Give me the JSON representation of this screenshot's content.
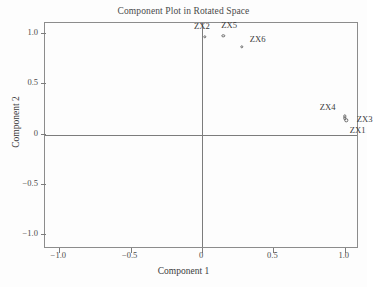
{
  "chart_data": {
    "type": "scatter",
    "title": "Component Plot in Rotated Space",
    "xlabel": "Component 1",
    "ylabel": "Component 2",
    "xlim": [
      -1.1,
      1.1
    ],
    "ylim": [
      -1.15,
      1.1
    ],
    "grid": false,
    "legend": null,
    "xticks": [
      -1.0,
      -0.5,
      0,
      0.5,
      1.0
    ],
    "xticklabels": [
      "-1.0",
      "-0.5",
      "0",
      "0.5",
      "1.0"
    ],
    "yticks": [
      1.0,
      0.5,
      0,
      -0.5,
      -1.0
    ],
    "yticklabels": [
      "1.0",
      "0.5",
      "0",
      "-0.5",
      "-1.0"
    ],
    "points": [
      {
        "label": "ZX2",
        "x": 0.02,
        "y": 0.96,
        "label_dx": -0.02,
        "label_dy": 0.11
      },
      {
        "label": "ZX5",
        "x": 0.15,
        "y": 0.97,
        "label_dx": 0.04,
        "label_dy": 0.11
      },
      {
        "label": "ZX6",
        "x": 0.28,
        "y": 0.86,
        "label_dx": 0.11,
        "label_dy": 0.08
      },
      {
        "label": "ZX4",
        "x": 1.0,
        "y": 0.17,
        "label_dx": -0.12,
        "label_dy": 0.09
      },
      {
        "label": "ZX3",
        "x": 1.0,
        "y": 0.15,
        "label_dx": 0.14,
        "label_dy": -0.01
      },
      {
        "label": "ZX1",
        "x": 1.01,
        "y": 0.13,
        "label_dx": 0.08,
        "label_dy": -0.09
      }
    ]
  }
}
